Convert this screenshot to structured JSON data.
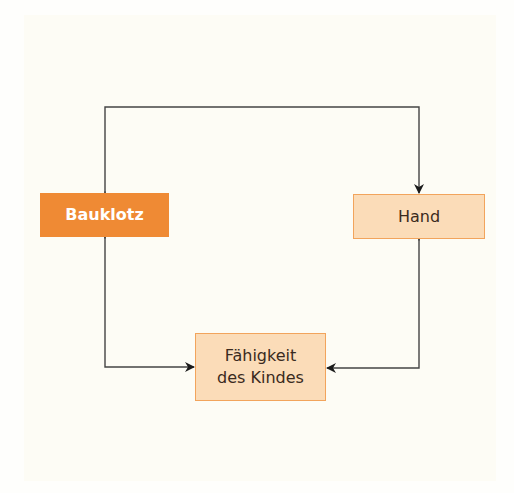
{
  "diagram": {
    "nodes": [
      {
        "id": "bauklotz",
        "label": "Bauklotz",
        "style": "primary"
      },
      {
        "id": "hand",
        "label": "Hand",
        "style": "secondary"
      },
      {
        "id": "faehigkeit",
        "label_line1": "Fähigkeit",
        "label_line2": "des Kindes",
        "style": "secondary"
      }
    ],
    "edges": [
      {
        "from": "bauklotz",
        "to": "hand",
        "type": "bidirectional",
        "route": "over-top"
      },
      {
        "from": "bauklotz",
        "to": "faehigkeit",
        "type": "bidirectional",
        "route": "down-then-right"
      },
      {
        "from": "hand",
        "to": "faehigkeit",
        "type": "bidirectional",
        "route": "down-then-left"
      }
    ],
    "colors": {
      "primary_fill": "#ef8a34",
      "secondary_fill": "#fbdcb8",
      "secondary_border": "#f2a45c",
      "line": "#333333"
    }
  }
}
